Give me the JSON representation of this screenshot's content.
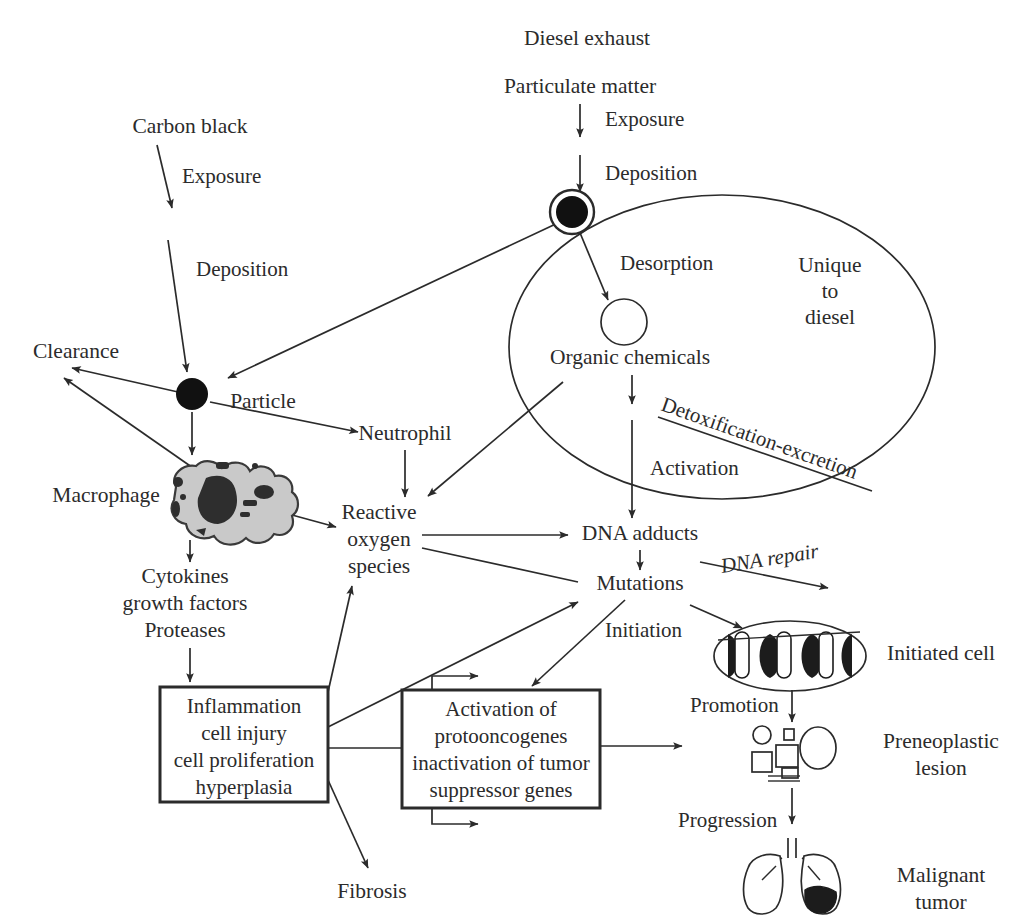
{
  "figure": {
    "ink_color": "#2b2b2b",
    "background_color": "#ffffff",
    "macrophage_fill": "#c9c9c9"
  },
  "nodes": {
    "diesel_exhaust": "Diesel exhaust",
    "particulate_matter": "Particulate matter",
    "carbon_black": "Carbon black",
    "clearance": "Clearance",
    "particle": "Particle",
    "neutrophil": "Neutrophil",
    "macrophage": "Macrophage",
    "cytokines_line1": "Cytokines",
    "cytokines_line2": "growth factors",
    "cytokines_line3": "Proteases",
    "ros_line1": "Reactive",
    "ros_line2": "oxygen",
    "ros_line3": "species",
    "organic_chemicals": "Organic chemicals",
    "dna_adducts": "DNA adducts",
    "mutations": "Mutations",
    "unique_line1": "Unique",
    "unique_line2": "to",
    "unique_line3": "diesel",
    "fibrosis": "Fibrosis",
    "initiated_cell": "Initiated cell",
    "preneoplastic_line1": "Preneoplastic",
    "preneoplastic_line2": "lesion",
    "malignant_line1": "Malignant",
    "malignant_line2": "tumor"
  },
  "edge_labels": {
    "exposure_diesel": "Exposure",
    "deposition_diesel": "Deposition",
    "exposure_carbon": "Exposure",
    "deposition_carbon": "Deposition",
    "desorption": "Desorption",
    "activation": "Activation",
    "detoxification_excretion": "Detoxification-excretion",
    "dna_repair": "DNA repair",
    "initiation": "Initiation",
    "promotion": "Promotion",
    "progression": "Progression"
  },
  "boxes": {
    "inflammation": {
      "lines": [
        "Inflammation",
        "cell injury",
        "cell proliferation",
        "hyperplasia"
      ]
    },
    "activation_genes": {
      "lines": [
        "Activation of",
        "protooncogenes",
        "inactivation of tumor",
        "suppressor genes"
      ]
    }
  },
  "icons": {
    "diesel_particle": "black-particle-with-ring-icon",
    "carbon_particle": "black-particle-icon",
    "desorbed_chemical": "open-circle-icon",
    "macrophage": "macrophage-cell-icon",
    "initiated_cell": "dna-double-helix-in-ellipse-icon",
    "preneoplastic_lesion": "abnormal-cell-cluster-icon",
    "malignant_tumor": "lungs-with-tumor-icon",
    "unique_region": "ellipse-boundary-icon"
  }
}
